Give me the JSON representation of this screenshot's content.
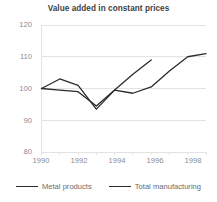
{
  "chart_data": {
    "type": "line",
    "title": "Value added in constant prices",
    "xlabel": "",
    "ylabel": "",
    "xlim": [
      1990,
      1999
    ],
    "ylim": [
      80,
      120
    ],
    "yticks": [
      80,
      90,
      100,
      110,
      120
    ],
    "xticks": [
      1990,
      1992,
      1994,
      1996,
      1998
    ],
    "grid": true,
    "legend_position": "bottom",
    "x": [
      1990,
      1991,
      1992,
      1993,
      1994,
      1995,
      1996,
      1997,
      1998,
      1999
    ],
    "series": [
      {
        "name": "Metal products",
        "color": "#2b2b2b",
        "x": [
          1990,
          1991,
          1992,
          1993,
          1994,
          1995,
          1996
        ],
        "values": [
          100,
          103,
          101,
          93.5,
          99.5,
          104.5,
          109
        ]
      },
      {
        "name": "Total manufacturing",
        "color": "#2b2b2b",
        "x": [
          1990,
          1991,
          1992,
          1993,
          1994,
          1995,
          1996,
          1997,
          1998,
          1999
        ],
        "values": [
          100,
          99.5,
          99,
          94.5,
          99.5,
          98.5,
          100.5,
          105.5,
          110,
          111
        ]
      }
    ]
  },
  "title": {
    "text": "Value added in constant prices"
  },
  "axes": {
    "y_labels": [
      "120",
      "110",
      "100",
      "90",
      "80"
    ],
    "x_labels": [
      "1990",
      "1992",
      "1994",
      "1996",
      "1998"
    ]
  },
  "legend": {
    "items": [
      {
        "label": "Metal products"
      },
      {
        "label": "Total manufacturing"
      }
    ]
  },
  "colors": {
    "line": "#2b2b2b",
    "grid": "#e3e3e3",
    "tick_text": "#8c8c8c",
    "title_text": "#3f3f3f"
  }
}
